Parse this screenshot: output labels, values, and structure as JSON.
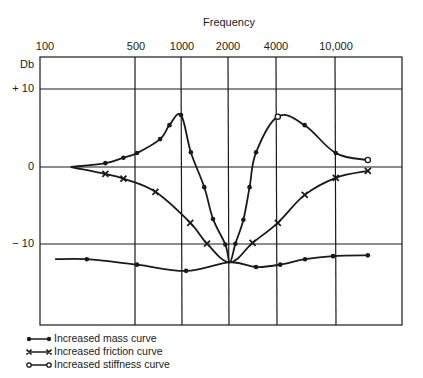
{
  "chart_data": {
    "type": "line",
    "title": "Frequency",
    "xlabel": "Frequency",
    "ylabel": "Db",
    "xscale": "log",
    "x_tick_labels": [
      "100",
      "500",
      "1000",
      "2000",
      "4000",
      "10,000"
    ],
    "y_tick_labels": [
      "+ 10",
      "0",
      "− 10"
    ],
    "yticks": [
      10,
      0,
      -10
    ],
    "ylim": [
      -20,
      12
    ],
    "grid": true,
    "legend_position": "bottom-left",
    "series": [
      {
        "name": "Increased mass curve",
        "marker": "filled-dot",
        "x": [
          150,
          242,
          515,
          1080,
          2090,
          3100,
          4460,
          6480,
          9880,
          16700
        ],
        "y": [
          -11.9,
          -11.9,
          -12.6,
          -13.4,
          -12.3,
          -12.9,
          -12.6,
          -11.9,
          -11.5,
          -11.4
        ]
      },
      {
        "name": "Increased friction curve",
        "marker": "x",
        "x": [
          190,
          320,
          420,
          680,
          1150,
          1480,
          2090,
          2940,
          4300,
          6450,
          10300,
          16700
        ],
        "y": [
          0,
          -0.9,
          -1.5,
          -3.2,
          -7.2,
          -9.9,
          -12.3,
          -9.8,
          -7.2,
          -3.6,
          -1.4,
          -0.5
        ]
      },
      {
        "name": "Increased stiffness curve",
        "marker": "open-circle",
        "x": [
          190,
          320,
          420,
          515,
          730,
          840,
          1000,
          1160,
          1420,
          1620,
          1950,
          2090,
          2270,
          2560,
          2810,
          3100,
          4300,
          6450,
          10300,
          16700
        ],
        "y": [
          0,
          0.5,
          1.2,
          1.8,
          3.6,
          5.4,
          6.7,
          1.9,
          -2.6,
          -6.7,
          -10.0,
          -12.3,
          -9.9,
          -6.8,
          -2.6,
          1.9,
          6.5,
          5.4,
          1.8,
          0.9
        ]
      }
    ]
  },
  "legend": {
    "items": [
      {
        "label": "Increased mass curve",
        "marker": "filled-dot"
      },
      {
        "label": "Increased friction curve",
        "marker": "x"
      },
      {
        "label": "Increased stiffness curve",
        "marker": "open-circle"
      }
    ]
  },
  "axis": {
    "title": "Frequency",
    "y_unit": "Db",
    "x_ticks": [
      "100",
      "500",
      "1000",
      "2000",
      "4000",
      "10,000"
    ],
    "y_ticks": [
      "+ 10",
      "0",
      "− 10"
    ]
  }
}
